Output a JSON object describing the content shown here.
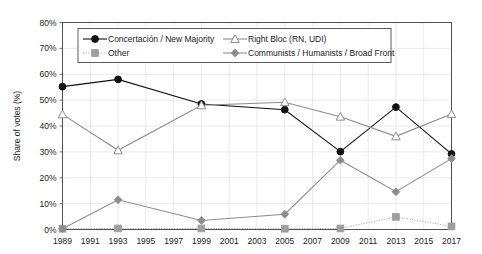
{
  "chart_data": {
    "type": "line",
    "title": "",
    "subtitle": "",
    "xlabel": "",
    "ylabel": "Share of votes (%)",
    "xlim": [
      1989,
      2017
    ],
    "ylim": [
      0,
      80
    ],
    "ytick_step": 10,
    "grid": true,
    "legend_position": "top-inside",
    "x_ticks": [
      1989,
      1991,
      1993,
      1995,
      1997,
      1999,
      2001,
      2003,
      2005,
      2007,
      2009,
      2011,
      2013,
      2015,
      2017
    ],
    "y_ticks": [
      "0%",
      "10%",
      "20%",
      "30%",
      "40%",
      "50%",
      "60%",
      "70%",
      "80%"
    ],
    "y_tick_values": [
      0,
      10,
      20,
      30,
      40,
      50,
      60,
      70,
      80
    ],
    "x": [
      1989,
      1993,
      1999,
      2005,
      2009,
      2013,
      2017
    ],
    "series": [
      {
        "name": "Concertación / New Majority",
        "color": "#111111",
        "marker": "circle-filled",
        "line_style": "solid",
        "values": [
          55.2,
          58.0,
          48.5,
          46.3,
          30.1,
          47.3,
          29.2
        ]
      },
      {
        "name": "Right Bloc (RN, UDI)",
        "color": "#8c8c8c",
        "marker": "triangle-open",
        "line_style": "solid",
        "values": [
          44.5,
          30.6,
          48.0,
          49.2,
          43.6,
          36.0,
          44.6
        ]
      },
      {
        "name": "Other",
        "color": "#9e9e9e",
        "marker": "square-filled",
        "line_style": "dotted",
        "values": [
          0.3,
          0.4,
          0.4,
          0.3,
          0.4,
          4.9,
          1.2
        ]
      },
      {
        "name": "Communists / Humanists / Broad Front",
        "color": "#8c8c8c",
        "marker": "diamond-filled",
        "line_style": "solid",
        "values": [
          0.3,
          11.5,
          3.5,
          5.9,
          26.8,
          14.6,
          27.4
        ]
      }
    ]
  },
  "legend": {
    "entries": [
      {
        "label": "Concertación / New Majority"
      },
      {
        "label": "Right Bloc (RN, UDI)"
      },
      {
        "label": "Other"
      },
      {
        "label": "Communists / Humanists / Broad Front"
      }
    ]
  },
  "colors": {
    "background": "#ffffff",
    "frame": "#4d4d4d",
    "grid": "#dcdcdc",
    "text": "#1a1a1a",
    "series_dark": "#111111",
    "series_gray": "#8c8c8c",
    "series_light_gray": "#9e9e9e"
  }
}
